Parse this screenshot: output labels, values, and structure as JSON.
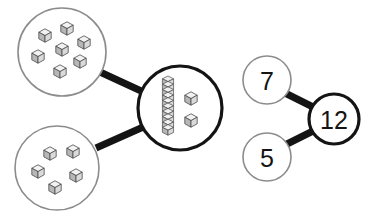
{
  "diagram": {
    "type": "number-bond",
    "equation": "7 + 5 = 12",
    "background_color": "#ffffff",
    "colors": {
      "thin_outline": "#8c8c8c",
      "thick_outline": "#141414",
      "connector": "#141414",
      "cube_top": "#f2f2f2",
      "cube_left": "#b5b5b5",
      "cube_right": "#d8d8d8",
      "cube_stroke": "#4a4a4a",
      "text": "#141414"
    },
    "parts": [
      {
        "name": "part-one",
        "numeral": "7",
        "cube_count": 7,
        "representation": "loose-cubes"
      },
      {
        "name": "part-two",
        "numeral": "5",
        "cube_count": 5,
        "representation": "loose-cubes"
      }
    ],
    "whole": {
      "name": "whole",
      "numeral": "12",
      "cube_count": 12,
      "representation": "one-ten-rod-and-two-loose-cubes",
      "rod_cubes": 10,
      "loose_cubes": 2
    },
    "cube_groups": {
      "top_left_circle": {
        "label": "seven-cubes-circle",
        "count": 7,
        "cubes": [
          {
            "x": 45,
            "y": 34
          },
          {
            "x": 67,
            "y": 27
          },
          {
            "x": 84,
            "y": 41
          },
          {
            "x": 62,
            "y": 48
          },
          {
            "x": 38,
            "y": 55
          },
          {
            "x": 80,
            "y": 60
          },
          {
            "x": 60,
            "y": 70
          }
        ]
      },
      "bottom_left_circle": {
        "label": "five-cubes-circle",
        "count": 5,
        "cubes": [
          {
            "x": 50,
            "y": 152
          },
          {
            "x": 73,
            "y": 150
          },
          {
            "x": 38,
            "y": 170
          },
          {
            "x": 76,
            "y": 174
          },
          {
            "x": 55,
            "y": 186
          }
        ]
      },
      "center_circle": {
        "label": "twelve-cubes-circle",
        "rod": {
          "x": 168,
          "y_top": 78,
          "cubes": 10
        },
        "loose": [
          {
            "x": 189,
            "y": 97
          },
          {
            "x": 189,
            "y": 118
          }
        ]
      }
    },
    "circles": {
      "top_left": {
        "cx": 62,
        "cy": 52,
        "r": 44,
        "stroke": "thin"
      },
      "bottom_left": {
        "cx": 57,
        "cy": 168,
        "r": 42,
        "stroke": "thin"
      },
      "center": {
        "cx": 180,
        "cy": 108,
        "r": 42,
        "stroke": "thick"
      },
      "seven": {
        "cx": 267,
        "cy": 80,
        "r": 24,
        "stroke": "thin"
      },
      "five": {
        "cx": 267,
        "cy": 157,
        "r": 24,
        "stroke": "thin"
      },
      "twelve": {
        "cx": 334,
        "cy": 119,
        "r": 25,
        "stroke": "thick"
      }
    },
    "connectors": [
      {
        "name": "seven-cubes-to-whole",
        "from": "top_left",
        "to": "center"
      },
      {
        "name": "five-cubes-to-whole",
        "from": "bottom_left",
        "to": "center"
      },
      {
        "name": "seven-to-twelve",
        "from": "seven",
        "to": "twelve"
      },
      {
        "name": "five-to-twelve",
        "from": "five",
        "to": "twelve"
      }
    ]
  }
}
